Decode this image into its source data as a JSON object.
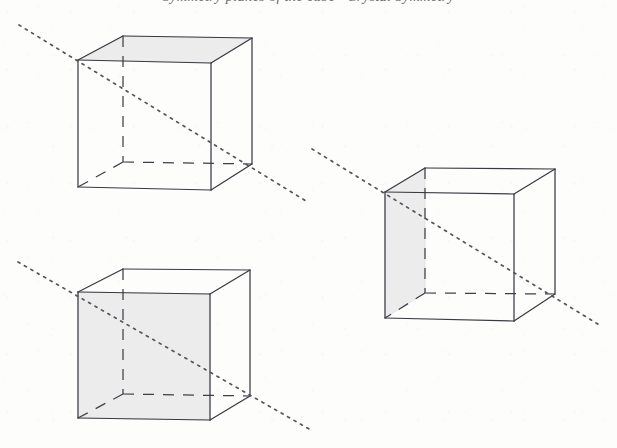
{
  "figure": {
    "background_color": "#fdfdfc",
    "edge_color": "#3a3a44",
    "hidden_edge_color": "#3f3f49",
    "shade_color": "#ececec",
    "shade_stroke": "#d8d8d8",
    "dotted_line_color": "#55555f",
    "width": 617,
    "height": 448
  },
  "running_head": {
    "text": "Symmetry planes of the cube · Crystal Symmetry",
    "clipped": "true"
  },
  "cubes": [
    {
      "id": "cube-top-left",
      "label": "Cube with shaded top face",
      "shaded_face": "top",
      "vertices": {
        "front_top_left": [
          78,
          60
        ],
        "front_top_right": [
          211,
          63
        ],
        "front_bottom_left": [
          78,
          187
        ],
        "front_bottom_right": [
          211,
          190
        ],
        "back_top_left": [
          123,
          36
        ],
        "back_top_right": [
          252,
          38
        ],
        "back_bottom_left": [
          123,
          162
        ],
        "back_bottom_right": [
          252,
          164
        ]
      },
      "symmetry_line": {
        "from": [
          19,
          25
        ],
        "to": [
          306,
          201
        ]
      }
    },
    {
      "id": "cube-right",
      "label": "Cube with shaded left side face",
      "shaded_face": "left",
      "vertices": {
        "front_top_left": [
          385,
          192
        ],
        "front_top_right": [
          514,
          194
        ],
        "front_bottom_left": [
          385,
          318
        ],
        "front_bottom_right": [
          514,
          321
        ],
        "back_top_left": [
          425,
          168
        ],
        "back_top_right": [
          555,
          169
        ],
        "back_bottom_left": [
          425,
          293
        ],
        "back_bottom_right": [
          555,
          294
        ]
      },
      "symmetry_line": {
        "from": [
          312,
          149
        ],
        "to": [
          601,
          326
        ]
      }
    },
    {
      "id": "cube-bottom-left",
      "label": "Cube with shaded front face",
      "shaded_face": "front",
      "vertices": {
        "front_top_left": [
          78,
          292
        ],
        "front_top_right": [
          210,
          294
        ],
        "front_bottom_left": [
          78,
          418
        ],
        "front_bottom_right": [
          210,
          420
        ],
        "back_top_left": [
          123,
          269
        ],
        "back_top_right": [
          250,
          270
        ],
        "back_bottom_left": [
          123,
          394
        ],
        "back_bottom_right": [
          250,
          396
        ]
      },
      "symmetry_line": {
        "from": [
          18,
          262
        ],
        "to": [
          309,
          429
        ]
      }
    }
  ]
}
